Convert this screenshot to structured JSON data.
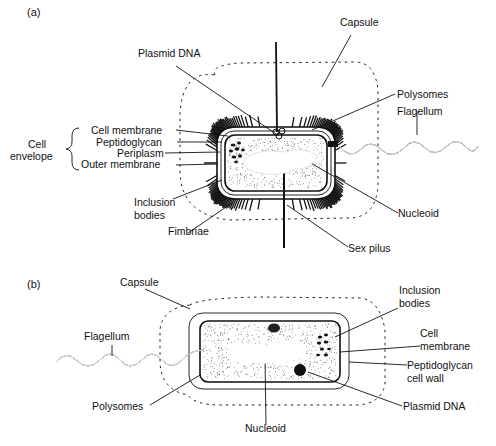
{
  "figure": {
    "panel_a": {
      "panel_label": "(a)",
      "labels": {
        "capsule": "Capsule",
        "plasmid_dna": "Plasmid DNA",
        "polysomes": "Polysomes",
        "flagellum": "Flagellum",
        "cell_envelope_line1": "Cell",
        "cell_envelope_line2": "envelope",
        "cell_membrane": "Cell membrane",
        "peptidoglycan": "Peptidoglycan",
        "periplasm": "Periplasm",
        "outer_membrane": "Outer membrane",
        "inclusion_bodies_line1": "Inclusion",
        "inclusion_bodies_line2": "bodies",
        "fimbriae": "Fimbriae",
        "nucleoid": "Nucleoid",
        "sex_pilus": "Sex pilus"
      }
    },
    "panel_b": {
      "panel_label": "(b)",
      "labels": {
        "capsule": "Capsule",
        "flagellum": "Flagellum",
        "polysomes": "Polysomes",
        "nucleoid": "Nucleoid",
        "inclusion_bodies_line1": "Inclusion",
        "inclusion_bodies_line2": "bodies",
        "cell_membrane_line1": "Cell",
        "cell_membrane_line2": "membrane",
        "peptidoglycan_line1": "Peptidoglycan",
        "peptidoglycan_line2": "cell wall",
        "plasmid_dna": "Plasmid DNA"
      }
    }
  }
}
